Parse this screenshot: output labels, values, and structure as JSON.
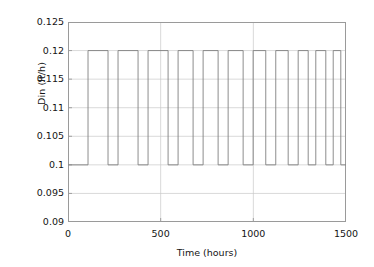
{
  "chart_data": {
    "type": "line",
    "title": "",
    "subtitle": "",
    "xlabel": "Time (hours)",
    "ylabel": "Din (lt/h)",
    "xlim": [
      0,
      1500
    ],
    "ylim": [
      0.09,
      0.125
    ],
    "xticks": [
      0,
      500,
      1000,
      1500
    ],
    "xtick_labels": [
      "0",
      "500",
      "1000",
      "1500"
    ],
    "yticks": [
      0.09,
      0.095,
      0.1,
      0.105,
      0.11,
      0.115,
      0.12,
      0.125
    ],
    "ytick_labels": [
      "0.09",
      "0.095",
      "0.1",
      "0.105",
      "0.11",
      "0.115",
      "0.12",
      "0.125"
    ],
    "grid": true,
    "grid_color": "#c8c8c8",
    "line_color": "#808080",
    "legend": null,
    "annotations": [],
    "series": [
      {
        "name": "Din",
        "drawstyle": "steps-post",
        "low_value": 0.1,
        "high_value": 0.12,
        "description": "Square wave alternating between 0.1 and 0.12 lt/h; pulse period shortens toward later times",
        "x": [
          0,
          108,
          216,
          270,
          378,
          432,
          540,
          594,
          675,
          729,
          810,
          864,
          945,
          999,
          1067,
          1121,
          1188,
          1242,
          1296,
          1337,
          1391,
          1431,
          1472,
          1500
        ],
        "y": [
          0.1,
          0.12,
          0.1,
          0.12,
          0.1,
          0.12,
          0.1,
          0.12,
          0.1,
          0.12,
          0.1,
          0.12,
          0.1,
          0.12,
          0.1,
          0.12,
          0.1,
          0.12,
          0.1,
          0.12,
          0.1,
          0.12,
          0.1,
          0.1
        ]
      }
    ]
  }
}
